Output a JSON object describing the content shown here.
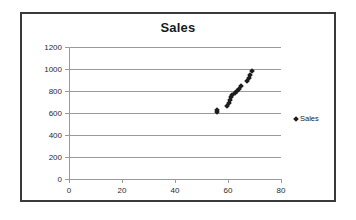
{
  "chart_data": {
    "type": "scatter",
    "title": "Sales",
    "xlabel": "",
    "ylabel": "",
    "xlim": [
      0,
      80
    ],
    "ylim": [
      0,
      1200
    ],
    "xticks": [
      0,
      20,
      40,
      60,
      80
    ],
    "yticks": [
      0,
      200,
      400,
      600,
      800,
      1000,
      1200
    ],
    "grid": true,
    "legend_position": "right",
    "series": [
      {
        "name": "Sales",
        "marker": "diamond",
        "color": "#1c1c1c",
        "points": [
          [
            55.8,
            605
          ],
          [
            56.0,
            625
          ],
          [
            59.8,
            665
          ],
          [
            60.3,
            690
          ],
          [
            60.8,
            715
          ],
          [
            61.2,
            745
          ],
          [
            61.6,
            765
          ],
          [
            62.6,
            780
          ],
          [
            63.3,
            800
          ],
          [
            64.3,
            820
          ],
          [
            65.0,
            845
          ],
          [
            67.2,
            895
          ],
          [
            67.8,
            920
          ],
          [
            68.4,
            950
          ],
          [
            69.0,
            985
          ]
        ]
      }
    ]
  },
  "legend": {
    "entries": [
      {
        "label": "Sales",
        "marker": "diamond-marker-icon"
      }
    ]
  }
}
